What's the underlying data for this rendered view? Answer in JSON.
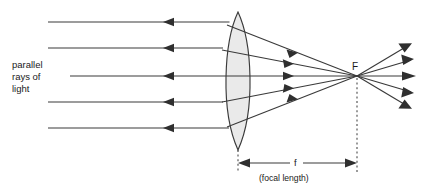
{
  "diagram": {
    "title_label": "parallel rays of light",
    "labels": {
      "incoming_rays_line1": "parallel",
      "incoming_rays_line2": "rays of",
      "incoming_rays_line3": "light",
      "focal_point": "F",
      "focal_length_symbol": "f",
      "focal_length_caption": "(focal length)"
    },
    "colors": {
      "background": "#ffffff",
      "stroke": "#3a3a3a",
      "arrow_fill": "#2f2f2f",
      "lens_fill": "#eaeaea",
      "lens_stroke": "#3a3a3a",
      "text": "#1a1a1a",
      "dashed_line": "#4a4a4a"
    },
    "optics": {
      "lens_type": "biconvex-converging",
      "lens_center_x": 238,
      "lens_top_y": 12,
      "lens_bottom_y": 150,
      "lens_half_width": 18,
      "focal_point_x": 357,
      "focal_point_y": 76,
      "optical_axis_y": 76,
      "incoming_ray_start_x": 48,
      "incoming_ray_count": 5,
      "outgoing_ray_count": 5,
      "incoming_ray_y_values": [
        22,
        48,
        76,
        102,
        128
      ],
      "incoming_arrow_x": 172,
      "outgoing_ray_end_x": 412,
      "outgoing_ray_end_y_values": [
        46,
        60,
        76,
        92,
        107
      ],
      "dimension_line_y": 163,
      "dimension_left_x": 238,
      "dimension_right_x": 357
    }
  }
}
